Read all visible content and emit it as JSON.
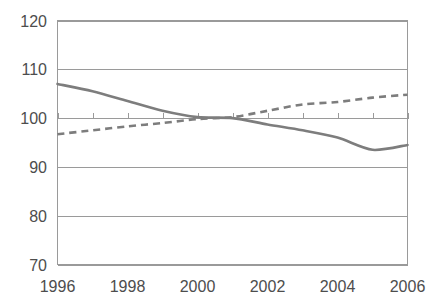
{
  "chart_data": {
    "type": "line",
    "title": "",
    "subtitle": "",
    "xlabel": "",
    "ylabel": "",
    "x": [
      1996,
      1997,
      1998,
      1999,
      2000,
      2001,
      2002,
      2003,
      2004,
      2005,
      2006
    ],
    "xlim": [
      1996,
      2006
    ],
    "ylim": [
      70,
      120
    ],
    "y_ticks": [
      70,
      80,
      90,
      100,
      110,
      120
    ],
    "y_tick_labels": [
      "70",
      "80",
      "90",
      "100",
      "110",
      "120"
    ],
    "x_ticks": [
      1996,
      1997,
      1998,
      1999,
      2000,
      2001,
      2002,
      2003,
      2004,
      2005,
      2006
    ],
    "x_tick_labels_shown": [
      "1996",
      "1998",
      "2000",
      "2002",
      "2004",
      "2006"
    ],
    "x_labeled_values": [
      1996,
      1998,
      2000,
      2002,
      2004,
      2006
    ],
    "grid": "horizontal",
    "legend": "none",
    "series": [
      {
        "name": "series-solid",
        "style": "solid",
        "color": "#7d7d7d",
        "values": [
          107.0,
          105.5,
          103.5,
          101.5,
          100.2,
          100.0,
          98.7,
          97.5,
          96.0,
          93.5,
          94.5
        ]
      },
      {
        "name": "series-dashed",
        "style": "dashed",
        "color": "#7d7d7d",
        "values": [
          96.7,
          97.5,
          98.3,
          99.0,
          99.8,
          100.2,
          101.5,
          102.8,
          103.3,
          104.2,
          104.8
        ]
      }
    ],
    "annotations": []
  },
  "axis": {
    "y_labels": [
      "120",
      "110",
      "100",
      "90",
      "80",
      "70"
    ],
    "x_labels": [
      "1996",
      "1998",
      "2000",
      "2002",
      "2004",
      "2006"
    ]
  },
  "colors": {
    "line": "#7d7d7d",
    "grid": "#9a9a9a",
    "text": "#4d4d4d",
    "background": "#ffffff"
  }
}
